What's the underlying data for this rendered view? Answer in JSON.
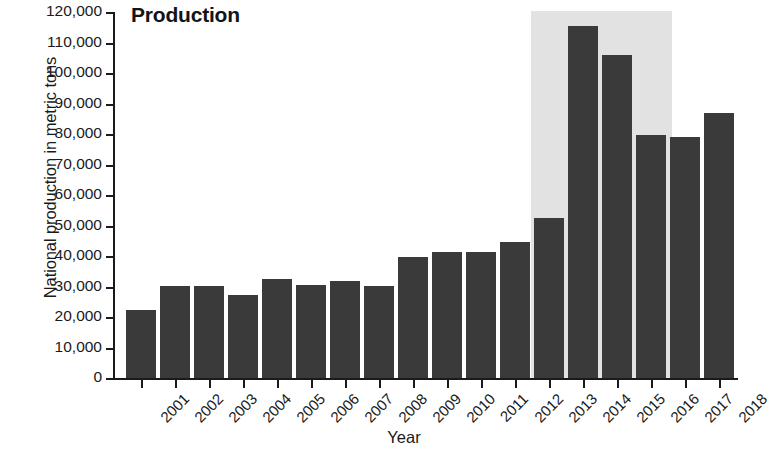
{
  "chart_data": {
    "type": "bar",
    "title": "Production",
    "xlabel": "Year",
    "ylabel": "National production in metric tons",
    "categories": [
      "2001",
      "2002",
      "2003",
      "2004",
      "2005",
      "2006",
      "2007",
      "2008",
      "2009",
      "2010",
      "2011",
      "2012",
      "2013",
      "2014",
      "2015",
      "2016",
      "2017",
      "2018"
    ],
    "values": [
      22300,
      30200,
      30200,
      27200,
      32600,
      30500,
      31800,
      30200,
      39700,
      41200,
      41200,
      44500,
      52500,
      115500,
      106000,
      79800,
      79000,
      87000
    ],
    "ylim": [
      0,
      120000
    ],
    "ytick_labels": [
      "120,000",
      "110,000",
      "100,000",
      "90,000",
      "80,000",
      "70,000",
      "60,000",
      "50,000",
      "40,000",
      "30,000",
      "20,000",
      "10,000",
      "0"
    ],
    "ytick_values": [
      120000,
      110000,
      100000,
      90000,
      80000,
      70000,
      60000,
      50000,
      40000,
      30000,
      20000,
      10000,
      0
    ],
    "grid": false,
    "legend": null,
    "bar_color": "#3a3a3a",
    "highlight": {
      "label": "highlighted period",
      "from_category": "2013",
      "to_category": "2016",
      "color": "#e2e2e2"
    }
  }
}
